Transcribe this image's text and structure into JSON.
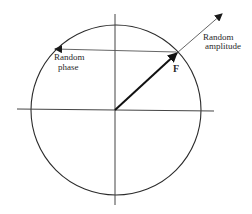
{
  "diagram": {
    "title": "",
    "labels": {
      "random_amplitude_line1": "Random",
      "random_amplitude_line2": "amplitude",
      "random_phase_line1": "Random",
      "random_phase_line2": "phase",
      "vector": "F"
    },
    "colors": {
      "stroke": "#2b2b2b",
      "thin_stroke": "#555555",
      "background": "#ffffff"
    }
  }
}
